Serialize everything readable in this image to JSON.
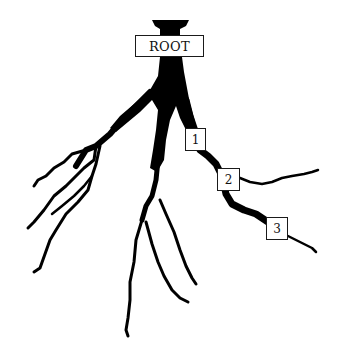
{
  "diagram": {
    "type": "root-system-illustration",
    "root_label": "ROOT",
    "markers": [
      {
        "id": "1",
        "label": "1"
      },
      {
        "id": "2",
        "label": "2"
      },
      {
        "id": "3",
        "label": "3"
      }
    ],
    "colors": {
      "root_fill": "#000000",
      "background": "#ffffff",
      "box_border": "#1a1a1a"
    }
  }
}
